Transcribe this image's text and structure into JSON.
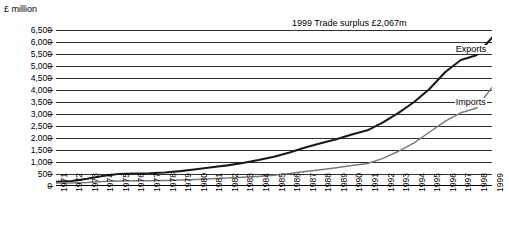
{
  "chart_data": {
    "type": "line",
    "title": "",
    "annotation": "1999 Trade surplus £2,067m",
    "ylabel": "£ million",
    "xlabel": "",
    "ylim": [
      0,
      6500
    ],
    "yticks": [
      0,
      500,
      1000,
      1500,
      2000,
      2500,
      3000,
      3500,
      4000,
      4500,
      5000,
      5500,
      6000,
      6500
    ],
    "ytick_labels": [
      "0",
      "500",
      "1,000",
      "1,500",
      "2,000",
      "2,500",
      "3,000",
      "3,500",
      "4,000",
      "4,500",
      "5,000",
      "5,500",
      "6,000",
      "6,500"
    ],
    "grid": true,
    "legend_position": "inline-right",
    "categories": [
      "1971",
      "1972",
      "1973",
      "1974",
      "1975",
      "1976",
      "1977",
      "1978",
      "1979",
      "1980",
      "1981",
      "1982",
      "1983",
      "1984",
      "1985",
      "1986",
      "1987",
      "1988",
      "1989",
      "1990",
      "1991",
      "1992",
      "1993",
      "1994",
      "1995",
      "1996",
      "1997",
      "1998",
      "1999"
    ],
    "series": [
      {
        "name": "Exports",
        "color": "#1a1a1a",
        "values": [
          180,
          210,
          300,
          420,
          500,
          520,
          530,
          560,
          620,
          700,
          780,
          860,
          960,
          1080,
          1220,
          1400,
          1600,
          1780,
          1950,
          2150,
          2320,
          2650,
          3050,
          3500,
          4050,
          4750,
          5250,
          5450,
          6180
        ]
      },
      {
        "name": "Imports",
        "color": "#7a7a7a",
        "values": [
          120,
          130,
          150,
          190,
          210,
          215,
          220,
          230,
          250,
          270,
          300,
          330,
          360,
          400,
          450,
          520,
          600,
          680,
          760,
          850,
          940,
          1150,
          1450,
          1800,
          2250,
          2700,
          3050,
          3250,
          4110
        ]
      }
    ]
  }
}
